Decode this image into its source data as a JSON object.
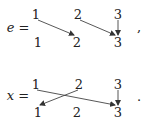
{
  "diagrams": [
    {
      "name": "e",
      "label": "e =",
      "punct": ",",
      "top": [
        "1",
        "2",
        "3"
      ],
      "bottom": [
        "1",
        "2",
        "3"
      ],
      "arrows": [
        {
          "from": 1,
          "to": 2
        },
        {
          "from": 2,
          "to": 3
        },
        {
          "from": 3,
          "to": 3
        }
      ]
    },
    {
      "name": "x",
      "label": "x =",
      "punct": ".",
      "top": [
        "1",
        "2",
        "3"
      ],
      "bottom": [
        "1",
        "2",
        "3"
      ],
      "arrows": [
        {
          "from": 1,
          "to": 3
        },
        {
          "from": 2,
          "to": 1
        },
        {
          "from": 3,
          "to": 3
        }
      ]
    }
  ]
}
